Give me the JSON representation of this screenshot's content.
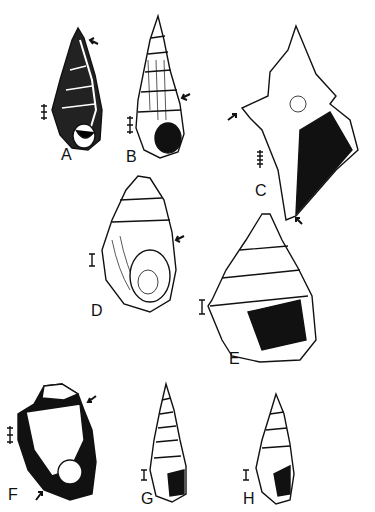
{
  "plate": {
    "figures": [
      {
        "id": "A",
        "label": "A",
        "scale": "triple-tick",
        "arrows": 1
      },
      {
        "id": "B",
        "label": "B",
        "scale": "triple-tick",
        "arrows": 1
      },
      {
        "id": "C",
        "label": "C",
        "scale": "multi-tick",
        "arrows": 2
      },
      {
        "id": "D",
        "label": "D",
        "scale": "single-bar",
        "arrows": 1
      },
      {
        "id": "E",
        "label": "E",
        "scale": "single-bar",
        "arrows": 0
      },
      {
        "id": "F",
        "label": "F",
        "scale": "triple-tick",
        "arrows": 2
      },
      {
        "id": "G",
        "label": "G",
        "scale": "single-bar",
        "arrows": 0
      },
      {
        "id": "H",
        "label": "H",
        "scale": "single-bar",
        "arrows": 0
      }
    ]
  }
}
